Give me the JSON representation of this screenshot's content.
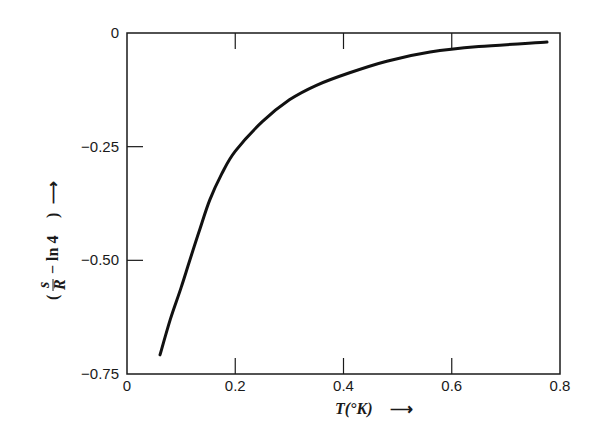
{
  "chart_data": {
    "type": "line",
    "title": "",
    "xlabel": "T(°K)",
    "ylabel": "(s/R − ln 4)",
    "xlim": [
      0,
      0.8
    ],
    "ylim": [
      -0.75,
      0
    ],
    "grid": false,
    "legend": null,
    "x_ticks": [
      "0",
      "0.2",
      "0.4",
      "0.6",
      "0.8"
    ],
    "y_ticks": [
      "0",
      "-0.25",
      "-0.50",
      "-0.75"
    ],
    "series": [
      {
        "name": "s/R - ln 4",
        "x": [
          0.061,
          0.08,
          0.1,
          0.116,
          0.135,
          0.153,
          0.175,
          0.2,
          0.25,
          0.3,
          0.35,
          0.41,
          0.48,
          0.56,
          0.65,
          0.776
        ],
        "values": [
          -0.708,
          -0.63,
          -0.56,
          -0.5,
          -0.43,
          -0.367,
          -0.31,
          -0.26,
          -0.195,
          -0.147,
          -0.115,
          -0.088,
          -0.062,
          -0.042,
          -0.03,
          -0.02
        ]
      }
    ]
  },
  "labels": {
    "xlabel_main": "T(°K)",
    "xlabel_arrow": "⟶",
    "ylabel_arrow": "⟶",
    "ylabel_paren_open": "(",
    "ylabel_num": "s",
    "ylabel_den": "R",
    "ylabel_rest": "− ln 4",
    "ylabel_paren_close": ")"
  },
  "colors": {
    "line": "#111111",
    "axes": "#1a1a1a",
    "background": "#ffffff"
  }
}
